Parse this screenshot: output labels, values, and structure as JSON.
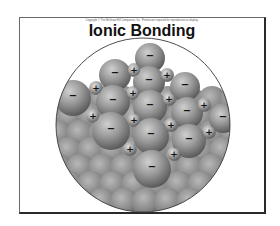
{
  "slide": {
    "copyright": "Copyright © The McGraw-Hill Companies, Inc. Permission required for reproduction or display.",
    "title": "Ionic Bonding"
  },
  "diagram": {
    "anion_symbol": "−",
    "cation_symbol": "+",
    "colors": {
      "sphere_light": "#c9c9c9",
      "sphere_mid": "#8e8e8e",
      "sphere_dark": "#4e4e4e",
      "circle_border": "#3a3a3a"
    },
    "anions": [
      {
        "x": 150,
        "y": 58,
        "r": 15
      },
      {
        "x": 115,
        "y": 75,
        "r": 16
      },
      {
        "x": 149,
        "y": 82,
        "r": 16
      },
      {
        "x": 185,
        "y": 87,
        "r": 15
      },
      {
        "x": 73,
        "y": 98,
        "r": 18
      },
      {
        "x": 113,
        "y": 102,
        "r": 17
      },
      {
        "x": 150,
        "y": 107,
        "r": 17
      },
      {
        "x": 187,
        "y": 113,
        "r": 16
      },
      {
        "x": 223,
        "y": 119,
        "r": 14
      },
      {
        "x": 111,
        "y": 131,
        "r": 19
      },
      {
        "x": 151,
        "y": 136,
        "r": 18
      },
      {
        "x": 189,
        "y": 141,
        "r": 17
      },
      {
        "x": 152,
        "y": 169,
        "r": 19
      }
    ],
    "cations": [
      {
        "x": 134,
        "y": 70,
        "r": 7
      },
      {
        "x": 167,
        "y": 75,
        "r": 7
      },
      {
        "x": 96,
        "y": 88,
        "r": 7
      },
      {
        "x": 133,
        "y": 93,
        "r": 7
      },
      {
        "x": 169,
        "y": 99,
        "r": 7
      },
      {
        "x": 204,
        "y": 105,
        "r": 7
      },
      {
        "x": 93,
        "y": 116,
        "r": 7
      },
      {
        "x": 134,
        "y": 120,
        "r": 7
      },
      {
        "x": 171,
        "y": 125,
        "r": 7
      },
      {
        "x": 209,
        "y": 132,
        "r": 7
      },
      {
        "x": 130,
        "y": 149,
        "r": 7
      },
      {
        "x": 174,
        "y": 154,
        "r": 7
      }
    ]
  }
}
